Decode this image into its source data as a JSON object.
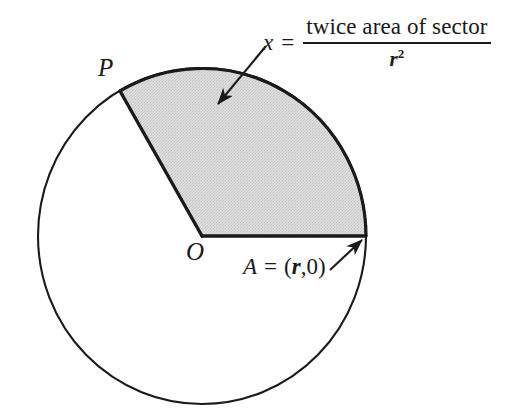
{
  "figure": {
    "background_color": "#ffffff",
    "stroke_color": "#1a1a1a",
    "sector_fill_color": "#d9d9d9",
    "circle": {
      "center_x": 202,
      "center_y": 236,
      "radius_x": 164,
      "radius_y": 168
    },
    "sector": {
      "start_angle_deg": 0,
      "end_angle_deg": 120,
      "vertex_label": "O",
      "arc_start_point_label": "A",
      "arc_end_point_label": "P"
    }
  },
  "labels": {
    "point_p": "P",
    "point_o": "O",
    "point_a": {
      "symbol": "A",
      "equals": "=",
      "open_paren": "(",
      "radius_var": "r",
      "comma_zero": ",0",
      "close_paren": ")"
    }
  },
  "formula": {
    "variable": "x",
    "equals": "=",
    "numerator": "twice area of sector",
    "denominator_base": "r",
    "denominator_exponent": "2"
  },
  "annotations": {
    "sector_arrow": {
      "name": "arrow-to-sector",
      "from_x": 266,
      "from_y": 46,
      "to_x": 216,
      "to_y": 106
    },
    "point_a_arrow": {
      "name": "arrow-to-point-a",
      "from_x": 330,
      "from_y": 270,
      "to_x": 363,
      "to_y": 239
    }
  }
}
